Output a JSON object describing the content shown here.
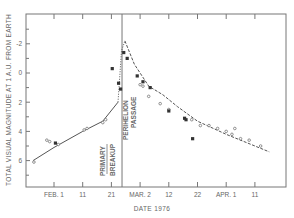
{
  "chart_data": {
    "type": "scatter",
    "title": "",
    "xlabel": "DATE 1976",
    "ylabel": "TOTAL VISUAL MAGNITUDE AT 1 A.U. FROM EARTH",
    "x_unit": "days from FEB 1 1976",
    "xlim": [
      -10,
      80
    ],
    "ylim": [
      7.8,
      -4.0
    ],
    "y_inverted": true,
    "grid": false,
    "x_ticks": [
      {
        "day": 0,
        "label": "FEB. 1"
      },
      {
        "day": 10,
        "label": "11"
      },
      {
        "day": 20,
        "label": "21"
      },
      {
        "day": 30,
        "label": "MAR. 2"
      },
      {
        "day": 40,
        "label": "12"
      },
      {
        "day": 50,
        "label": "22"
      },
      {
        "day": 60,
        "label": "APR. 1"
      },
      {
        "day": 70,
        "label": "11"
      }
    ],
    "y_ticks": [
      {
        "value": -2,
        "label": "-2"
      },
      {
        "value": 0,
        "label": "0"
      },
      {
        "value": 2,
        "label": "2"
      },
      {
        "value": 4,
        "label": "4"
      },
      {
        "value": 6,
        "label": "6"
      }
    ],
    "y_minor_ticks": [
      -3,
      -1,
      1,
      3,
      5,
      7
    ],
    "annotations": [
      {
        "text": "PRIMARY",
        "day": 20.5,
        "orientation": "vertical"
      },
      {
        "text": "BREAKUP",
        "day": 20.5,
        "orientation": "vertical"
      },
      {
        "text": "PERIHELION",
        "day": 23.7,
        "orientation": "vertical"
      },
      {
        "text": "PASSAGE",
        "day": 23.7,
        "orientation": "vertical"
      }
    ],
    "perihelion_line_day": 23.7,
    "series": [
      {
        "name": "pre-perihelion fit",
        "style": "solid",
        "points": [
          [
            -7.3,
            6.0
          ],
          [
            0,
            5.1
          ],
          [
            10,
            4.0
          ],
          [
            17,
            3.3
          ],
          [
            22.3,
            2.0
          ]
        ]
      },
      {
        "name": "breakup rise",
        "style": "dotted",
        "points": [
          [
            22.3,
            2.0
          ],
          [
            23.0,
            0.0
          ],
          [
            23.5,
            -1.5
          ],
          [
            24.7,
            -2.2
          ]
        ]
      },
      {
        "name": "post-perihelion fit",
        "style": "dashed",
        "points": [
          [
            24.7,
            -2.2
          ],
          [
            28,
            -0.6
          ],
          [
            33,
            0.9
          ],
          [
            38,
            1.5
          ],
          [
            43,
            2.3
          ],
          [
            50,
            3.3
          ],
          [
            60,
            4.2
          ],
          [
            70,
            5.0
          ],
          [
            75,
            5.4
          ]
        ]
      },
      {
        "name": "observations (open)",
        "marker": "open-circle",
        "points": [
          [
            -7,
            6.1
          ],
          [
            -2.5,
            4.6
          ],
          [
            -1.5,
            4.7
          ],
          [
            1.5,
            4.9
          ],
          [
            10.5,
            3.9
          ],
          [
            11.5,
            3.8
          ],
          [
            17,
            3.4
          ],
          [
            18,
            3.2
          ],
          [
            30,
            0.8
          ],
          [
            31,
            0.9
          ],
          [
            33,
            1.6
          ],
          [
            37,
            2.1
          ],
          [
            40,
            2.5
          ],
          [
            48,
            3.2
          ],
          [
            51,
            3.6
          ],
          [
            54,
            3.6
          ],
          [
            57,
            3.8
          ],
          [
            60,
            4.0
          ],
          [
            62,
            4.2
          ],
          [
            63,
            3.8
          ],
          [
            65,
            4.5
          ],
          [
            68,
            4.6
          ],
          [
            72,
            5.0
          ]
        ]
      },
      {
        "name": "observations (filled)",
        "marker": "filled-square",
        "points": [
          [
            0.5,
            4.8
          ],
          [
            20.3,
            -0.3
          ],
          [
            22.5,
            0.7
          ],
          [
            23.2,
            1.1
          ],
          [
            24.3,
            -1.4
          ],
          [
            25.5,
            -1.0
          ],
          [
            29,
            0.2
          ],
          [
            31,
            0.6
          ],
          [
            33.5,
            1.0
          ],
          [
            40,
            2.6
          ],
          [
            45.5,
            3.1
          ],
          [
            46,
            3.2
          ],
          [
            48.3,
            4.5
          ]
        ]
      }
    ]
  }
}
